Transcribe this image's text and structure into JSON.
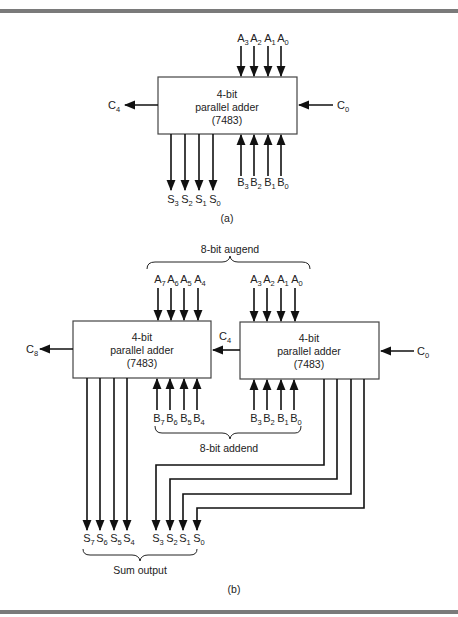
{
  "figure": {
    "part_a": {
      "caption": "(a)",
      "adder": {
        "line1": "4-bit",
        "line2": "parallel adder",
        "line3": "(7483)"
      },
      "carry_out": {
        "base": "C",
        "sub": "4"
      },
      "carry_in": {
        "base": "C",
        "sub": "0"
      },
      "a_inputs": [
        {
          "base": "A",
          "sub": "3"
        },
        {
          "base": "A",
          "sub": "2"
        },
        {
          "base": "A",
          "sub": "1"
        },
        {
          "base": "A",
          "sub": "0"
        }
      ],
      "b_inputs": [
        {
          "base": "B",
          "sub": "3"
        },
        {
          "base": "B",
          "sub": "2"
        },
        {
          "base": "B",
          "sub": "1"
        },
        {
          "base": "B",
          "sub": "0"
        }
      ],
      "sum_outputs": [
        {
          "base": "S",
          "sub": "3"
        },
        {
          "base": "S",
          "sub": "2"
        },
        {
          "base": "S",
          "sub": "1"
        },
        {
          "base": "S",
          "sub": "0"
        }
      ]
    },
    "part_b": {
      "caption": "(b)",
      "augend_label": "8-bit augend",
      "addend_label": "8-bit addend",
      "sum_label": "Sum output",
      "left_adder": {
        "line1": "4-bit",
        "line2": "parallel adder",
        "line3": "(7483)"
      },
      "right_adder": {
        "line1": "4-bit",
        "line2": "parallel adder",
        "line3": "(7483)"
      },
      "carry_out": {
        "base": "C",
        "sub": "8"
      },
      "carry_middle": {
        "base": "C",
        "sub": "4"
      },
      "carry_in": {
        "base": "C",
        "sub": "0"
      },
      "a_high": [
        {
          "base": "A",
          "sub": "7"
        },
        {
          "base": "A",
          "sub": "6"
        },
        {
          "base": "A",
          "sub": "5"
        },
        {
          "base": "A",
          "sub": "4"
        }
      ],
      "a_low": [
        {
          "base": "A",
          "sub": "3"
        },
        {
          "base": "A",
          "sub": "2"
        },
        {
          "base": "A",
          "sub": "1"
        },
        {
          "base": "A",
          "sub": "0"
        }
      ],
      "b_high": [
        {
          "base": "B",
          "sub": "7"
        },
        {
          "base": "B",
          "sub": "6"
        },
        {
          "base": "B",
          "sub": "5"
        },
        {
          "base": "B",
          "sub": "4"
        }
      ],
      "b_low": [
        {
          "base": "B",
          "sub": "3"
        },
        {
          "base": "B",
          "sub": "2"
        },
        {
          "base": "B",
          "sub": "1"
        },
        {
          "base": "B",
          "sub": "0"
        }
      ],
      "s_high": [
        {
          "base": "S",
          "sub": "7"
        },
        {
          "base": "S",
          "sub": "6"
        },
        {
          "base": "S",
          "sub": "5"
        },
        {
          "base": "S",
          "sub": "4"
        }
      ],
      "s_low": [
        {
          "base": "S",
          "sub": "3"
        },
        {
          "base": "S",
          "sub": "2"
        },
        {
          "base": "S",
          "sub": "1"
        },
        {
          "base": "S",
          "sub": "0"
        }
      ]
    }
  }
}
